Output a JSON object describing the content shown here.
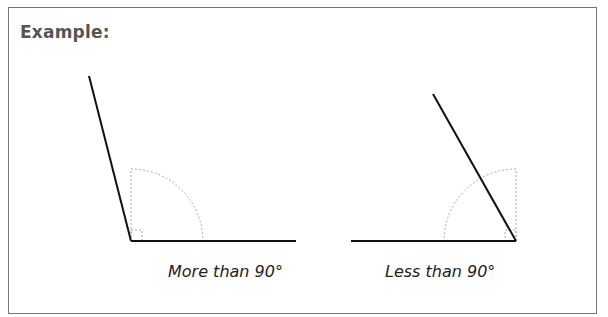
{
  "title": "Example:",
  "diagrams": [
    {
      "caption": "More than 90°",
      "type": "obtuse-angle"
    },
    {
      "caption": "Less than 90°",
      "type": "acute-angle"
    }
  ],
  "colors": {
    "border": "#777777",
    "title": "#555555",
    "line": "#111111",
    "guide": "#aaaaaa"
  }
}
